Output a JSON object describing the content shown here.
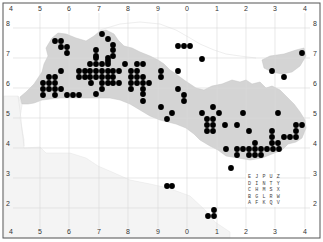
{
  "map": {
    "frame": {
      "x": 3,
      "y": 3,
      "width": 317,
      "height": 235
    },
    "colors": {
      "land": "#d4d4d4",
      "land_light": "#eeeeee",
      "sea": "#ffffff",
      "grid": "#d9d9d9",
      "frame": "#555555",
      "dot": "#000000",
      "label": "#333333"
    },
    "x_axis_labels": [
      {
        "text": "4",
        "x": 11
      },
      {
        "text": "5",
        "x": 40
      },
      {
        "text": "6",
        "x": 69
      },
      {
        "text": "7",
        "x": 99
      },
      {
        "text": "8",
        "x": 128
      },
      {
        "text": "9",
        "x": 158
      },
      {
        "text": "0",
        "x": 187
      },
      {
        "text": "1",
        "x": 217
      },
      {
        "text": "2",
        "x": 246
      },
      {
        "text": "3",
        "x": 275
      },
      {
        "text": "4",
        "x": 305
      }
    ],
    "y_axis_labels": [
      {
        "text": "8",
        "y": 26
      },
      {
        "text": "7",
        "y": 56
      },
      {
        "text": "6",
        "y": 86
      },
      {
        "text": "5",
        "y": 116
      },
      {
        "text": "4",
        "y": 146
      },
      {
        "text": "3",
        "y": 176
      },
      {
        "text": "2",
        "y": 206
      }
    ],
    "grid_x": [
      40,
      69,
      99,
      128,
      158,
      187,
      217,
      246,
      275,
      305
    ],
    "grid_y": [
      28,
      58,
      88,
      118,
      148,
      178,
      208
    ],
    "legend": {
      "rows": [
        "EJPUZ",
        "DINTY",
        "CHMSX",
        "BGLRW",
        "AFKQV"
      ],
      "x": 248,
      "y": 178
    },
    "dots": [
      [
        55,
        41
      ],
      [
        61,
        41
      ],
      [
        61,
        47
      ],
      [
        67,
        47
      ],
      [
        67,
        53
      ],
      [
        61,
        71
      ],
      [
        49,
        77
      ],
      [
        55,
        77
      ],
      [
        43,
        83
      ],
      [
        49,
        83
      ],
      [
        55,
        83
      ],
      [
        43,
        89
      ],
      [
        49,
        89
      ],
      [
        55,
        89
      ],
      [
        61,
        89
      ],
      [
        43,
        95
      ],
      [
        55,
        95
      ],
      [
        67,
        95
      ],
      [
        73,
        95
      ],
      [
        79,
        95
      ],
      [
        102,
        34
      ],
      [
        108,
        39
      ],
      [
        113,
        45
      ],
      [
        96,
        50
      ],
      [
        113,
        50
      ],
      [
        96,
        56
      ],
      [
        113,
        56
      ],
      [
        108,
        61
      ],
      [
        96,
        58
      ],
      [
        108,
        58
      ],
      [
        90,
        64
      ],
      [
        96,
        64
      ],
      [
        102,
        64
      ],
      [
        108,
        64
      ],
      [
        125,
        64
      ],
      [
        137,
        64
      ],
      [
        143,
        64
      ],
      [
        79,
        71
      ],
      [
        85,
        71
      ],
      [
        90,
        71
      ],
      [
        96,
        71
      ],
      [
        102,
        71
      ],
      [
        108,
        71
      ],
      [
        113,
        71
      ],
      [
        119,
        71
      ],
      [
        131,
        71
      ],
      [
        137,
        71
      ],
      [
        161,
        71
      ],
      [
        79,
        77
      ],
      [
        85,
        77
      ],
      [
        90,
        77
      ],
      [
        96,
        77
      ],
      [
        102,
        77
      ],
      [
        108,
        77
      ],
      [
        113,
        77
      ],
      [
        131,
        77
      ],
      [
        137,
        77
      ],
      [
        143,
        77
      ],
      [
        161,
        77
      ],
      [
        91,
        83
      ],
      [
        102,
        83
      ],
      [
        108,
        83
      ],
      [
        113,
        83
      ],
      [
        119,
        83
      ],
      [
        131,
        83
      ],
      [
        137,
        83
      ],
      [
        143,
        83
      ],
      [
        149,
        83
      ],
      [
        102,
        89
      ],
      [
        131,
        89
      ],
      [
        143,
        89
      ],
      [
        178,
        89
      ],
      [
        96,
        94
      ],
      [
        143,
        94
      ],
      [
        184,
        95
      ],
      [
        178,
        46
      ],
      [
        184,
        46
      ],
      [
        190,
        46
      ],
      [
        202,
        59
      ],
      [
        178,
        71
      ],
      [
        143,
        101
      ],
      [
        184,
        101
      ],
      [
        161,
        107
      ],
      [
        213,
        107
      ],
      [
        172,
        113
      ],
      [
        202,
        113
      ],
      [
        219,
        113
      ],
      [
        243,
        113
      ],
      [
        278,
        113
      ],
      [
        167,
        119
      ],
      [
        207,
        119
      ],
      [
        213,
        119
      ],
      [
        207,
        125
      ],
      [
        213,
        125
      ],
      [
        225,
        125
      ],
      [
        237,
        125
      ],
      [
        296,
        125
      ],
      [
        302,
        125
      ],
      [
        207,
        131
      ],
      [
        213,
        131
      ],
      [
        249,
        131
      ],
      [
        272,
        131
      ],
      [
        296,
        131
      ],
      [
        272,
        137
      ],
      [
        284,
        137
      ],
      [
        290,
        137
      ],
      [
        296,
        137
      ],
      [
        255,
        143
      ],
      [
        272,
        143
      ],
      [
        278,
        143
      ],
      [
        226,
        149
      ],
      [
        237,
        149
      ],
      [
        243,
        149
      ],
      [
        249,
        149
      ],
      [
        255,
        149
      ],
      [
        261,
        149
      ],
      [
        267,
        149
      ],
      [
        273,
        149
      ],
      [
        279,
        149
      ],
      [
        237,
        155
      ],
      [
        249,
        155
      ],
      [
        255,
        155
      ],
      [
        261,
        155
      ],
      [
        231,
        168
      ],
      [
        167,
        186
      ],
      [
        172,
        186
      ],
      [
        214,
        210
      ],
      [
        208,
        216
      ],
      [
        214,
        216
      ],
      [
        302,
        53
      ],
      [
        272,
        71
      ],
      [
        284,
        77
      ]
    ]
  }
}
